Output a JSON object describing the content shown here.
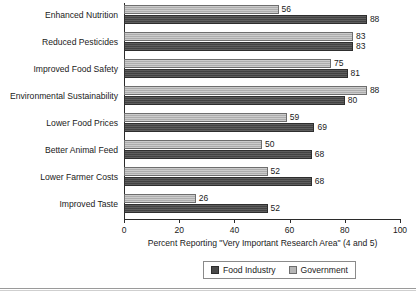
{
  "chart_data": {
    "type": "bar",
    "orientation": "horizontal",
    "title": "",
    "xlabel": "Percent Reporting \"Very Important Research Area\" (4 and 5)",
    "ylabel": "",
    "xlim": [
      0,
      100
    ],
    "xticks": [
      0,
      20,
      40,
      60,
      80,
      100
    ],
    "grid": false,
    "legend_position": "bottom-right",
    "categories": [
      "Enhanced Nutrition",
      "Reduced Pesticides",
      "Improved Food Safety",
      "Environmental Sustainability",
      "Lower Food Prices",
      "Better Animal Feed",
      "Lower Farmer Costs",
      "Improved Taste"
    ],
    "series": [
      {
        "name": "Food Industry",
        "color": "#4a4a4a",
        "values": [
          88,
          83,
          81,
          80,
          69,
          68,
          68,
          52
        ]
      },
      {
        "name": "Government",
        "color": "#b6b6b6",
        "values": [
          56,
          83,
          75,
          88,
          59,
          50,
          52,
          26
        ]
      }
    ]
  },
  "legend": {
    "items": [
      {
        "label": "Food Industry",
        "swatch": "dark-gray-swatch"
      },
      {
        "label": "Government",
        "swatch": "light-gray-swatch"
      }
    ]
  }
}
